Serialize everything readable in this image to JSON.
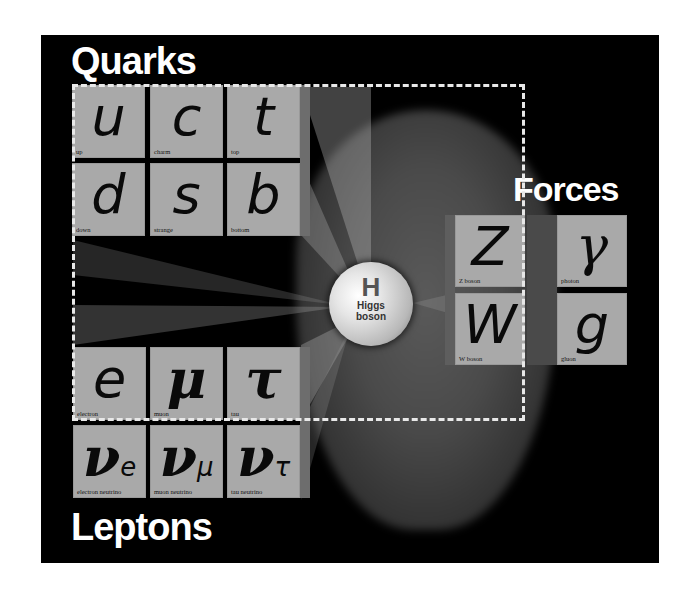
{
  "labels": {
    "quarks": "Quarks",
    "leptons": "Leptons",
    "forces": "Forces"
  },
  "higgs": {
    "symbol": "H",
    "name_line1": "Higgs",
    "name_line2": "boson"
  },
  "quarks": [
    {
      "symbol": "u",
      "name": "up"
    },
    {
      "symbol": "c",
      "name": "charm"
    },
    {
      "symbol": "t",
      "name": "top"
    },
    {
      "symbol": "d",
      "name": "down"
    },
    {
      "symbol": "s",
      "name": "strange"
    },
    {
      "symbol": "b",
      "name": "bottom"
    }
  ],
  "leptons": [
    {
      "symbol": "e",
      "name": "electron"
    },
    {
      "symbol": "μ",
      "name": "muon"
    },
    {
      "symbol": "τ",
      "name": "tau"
    },
    {
      "symbol": "ν",
      "subscript": "e",
      "name": "electron neutrino"
    },
    {
      "symbol": "ν",
      "subscript": "μ",
      "name": "muon neutrino"
    },
    {
      "symbol": "ν",
      "subscript": "τ",
      "name": "tau neutrino"
    }
  ],
  "forces": [
    {
      "symbol": "Z",
      "name": "Z boson"
    },
    {
      "symbol": "γ",
      "name": "photon"
    },
    {
      "symbol": "W",
      "name": "W boson"
    },
    {
      "symbol": "g",
      "name": "gluon"
    }
  ],
  "colors": {
    "background": "#000000",
    "tile": "#a9a9a9",
    "label_text": "#ffffff",
    "dashed_border": "#e8e8e8"
  }
}
